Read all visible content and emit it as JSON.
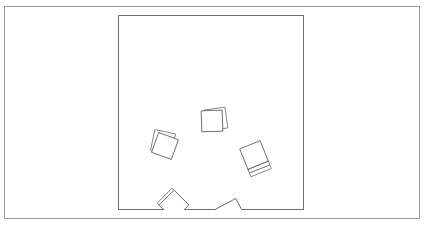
{
  "scene": {
    "title": "Scattered cards on a board",
    "canvas": {
      "width": 425,
      "height": 227,
      "background": "#ffffff"
    },
    "outer_frame": {
      "label": "outer-frame",
      "x": 4,
      "y": 6,
      "width": 416,
      "height": 213,
      "stroke": "#9a9a9a",
      "fill": "none"
    },
    "board": {
      "label": "board-area",
      "x": 118,
      "y": 15,
      "width": 186,
      "height": 195,
      "stroke": "#6f6f6f",
      "fill": "none"
    },
    "stroke_colors": {
      "frame": "#9a9a9a",
      "board": "#6f6f6f",
      "card_front": "#5d5d5d",
      "card_back": "#777777",
      "card_slice": "#6b6b6b"
    },
    "card_count": 5,
    "cards": [
      {
        "id": "card-top-center",
        "label": "card-top-center",
        "center_x": 212,
        "center_y": 121,
        "size": 21,
        "rotation_deg": -2,
        "layers": 2,
        "clipped": false,
        "back_offset_x": 4,
        "back_offset_y": -2,
        "back_rotation_deg": -8
      },
      {
        "id": "card-left",
        "label": "card-left",
        "center_x": 165,
        "center_y": 146,
        "size": 21,
        "rotation_deg": 20,
        "layers": 2,
        "clipped": false,
        "back_offset_x": -2,
        "back_offset_y": -4,
        "back_rotation_deg": 12
      },
      {
        "id": "card-right-stack",
        "label": "card-right-stack",
        "center_x": 254,
        "center_y": 155,
        "size": 22,
        "rotation_deg": -22,
        "layers": 3,
        "clipped": false,
        "slice_height": 4,
        "slice_count": 2
      },
      {
        "id": "card-bottom-left",
        "label": "card-bottom-left",
        "center_x": 174,
        "center_y": 205,
        "size": 21,
        "rotation_deg": 45,
        "layers": 2,
        "clipped": true,
        "back_offset_x": -2,
        "back_offset_y": -2,
        "back_rotation_deg": 45
      },
      {
        "id": "card-bottom-center",
        "label": "card-bottom-center",
        "center_x": 231,
        "center_y": 214,
        "size": 23,
        "rotation_deg": -28,
        "layers": 3,
        "clipped": true,
        "slice_height": 4,
        "slice_count": 2
      }
    ]
  }
}
